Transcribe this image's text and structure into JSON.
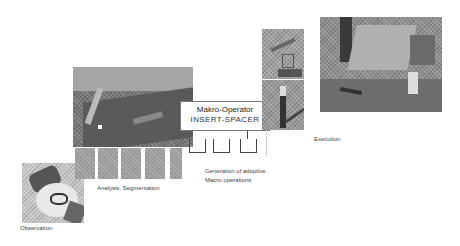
{
  "diagram": {
    "stages": [
      {
        "id": "observation",
        "label": "Observation"
      },
      {
        "id": "analysis",
        "label": "Analysis, Segmentation"
      },
      {
        "id": "generation",
        "label_line1": "Generation of adoptive",
        "label_line2": "Macro operations"
      },
      {
        "id": "execution",
        "label": "Execution"
      }
    ],
    "macro_operator": {
      "title": "Makro-Operator",
      "name": "INSERT-SPACER",
      "slots": [
        "...",
        "...",
        "..."
      ]
    }
  }
}
